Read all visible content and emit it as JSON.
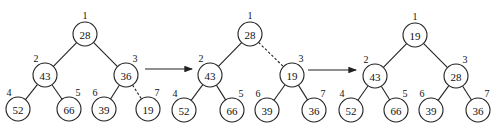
{
  "diagram": {
    "type": "heap-sift-down-steps",
    "node_radius": 12,
    "trees": [
      {
        "nodes": [
          {
            "index": "1",
            "value": "28",
            "x": 85,
            "y": 34
          },
          {
            "index": "2",
            "value": "43",
            "x": 45,
            "y": 75
          },
          {
            "index": "3",
            "value": "36",
            "x": 126,
            "y": 75
          },
          {
            "index": "4",
            "value": "52",
            "x": 18,
            "y": 109
          },
          {
            "index": "5",
            "value": "66",
            "x": 69,
            "y": 109
          },
          {
            "index": "6",
            "value": "39",
            "x": 104,
            "y": 109
          },
          {
            "index": "7",
            "value": "19",
            "x": 148,
            "y": 109
          }
        ],
        "edges": [
          {
            "from": 0,
            "to": 1,
            "dashed": false
          },
          {
            "from": 0,
            "to": 2,
            "dashed": false
          },
          {
            "from": 1,
            "to": 3,
            "dashed": false
          },
          {
            "from": 1,
            "to": 4,
            "dashed": false
          },
          {
            "from": 2,
            "to": 5,
            "dashed": false
          },
          {
            "from": 2,
            "to": 6,
            "dashed": true
          }
        ]
      },
      {
        "nodes": [
          {
            "index": "1",
            "value": "28",
            "x": 250,
            "y": 34
          },
          {
            "index": "2",
            "value": "43",
            "x": 210,
            "y": 75
          },
          {
            "index": "3",
            "value": "19",
            "x": 292,
            "y": 75
          },
          {
            "index": "4",
            "value": "52",
            "x": 184,
            "y": 110
          },
          {
            "index": "5",
            "value": "66",
            "x": 232,
            "y": 110
          },
          {
            "index": "6",
            "value": "39",
            "x": 267,
            "y": 110
          },
          {
            "index": "7",
            "value": "36",
            "x": 314,
            "y": 110
          }
        ],
        "edges": [
          {
            "from": 0,
            "to": 1,
            "dashed": false
          },
          {
            "from": 0,
            "to": 2,
            "dashed": true
          },
          {
            "from": 1,
            "to": 3,
            "dashed": false
          },
          {
            "from": 1,
            "to": 4,
            "dashed": false
          },
          {
            "from": 2,
            "to": 5,
            "dashed": false
          },
          {
            "from": 2,
            "to": 6,
            "dashed": false
          }
        ]
      },
      {
        "nodes": [
          {
            "index": "1",
            "value": "19",
            "x": 415,
            "y": 35
          },
          {
            "index": "2",
            "value": "43",
            "x": 375,
            "y": 76
          },
          {
            "index": "3",
            "value": "28",
            "x": 456,
            "y": 76
          },
          {
            "index": "4",
            "value": "52",
            "x": 351,
            "y": 110
          },
          {
            "index": "5",
            "value": "66",
            "x": 396,
            "y": 110
          },
          {
            "index": "6",
            "value": "39",
            "x": 431,
            "y": 110
          },
          {
            "index": "7",
            "value": "36",
            "x": 478,
            "y": 110
          }
        ],
        "edges": [
          {
            "from": 0,
            "to": 1,
            "dashed": false
          },
          {
            "from": 0,
            "to": 2,
            "dashed": false
          },
          {
            "from": 1,
            "to": 3,
            "dashed": false
          },
          {
            "from": 1,
            "to": 4,
            "dashed": false
          },
          {
            "from": 2,
            "to": 5,
            "dashed": false
          },
          {
            "from": 2,
            "to": 6,
            "dashed": false
          }
        ]
      }
    ],
    "arrows": [
      {
        "x1": 145,
        "y1": 69,
        "x2": 192,
        "y2": 69
      },
      {
        "x1": 308,
        "y1": 70,
        "x2": 356,
        "y2": 70
      }
    ]
  }
}
